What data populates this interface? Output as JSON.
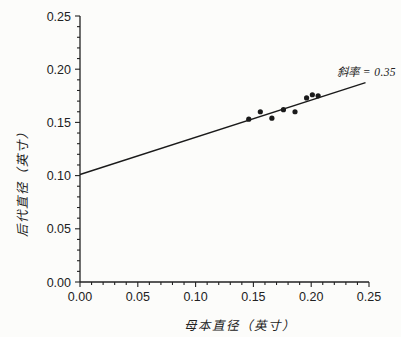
{
  "chart_data": {
    "type": "scatter",
    "title": "",
    "xlabel": "母本直径（英寸）",
    "ylabel": "后代直径（英寸）",
    "xlim": [
      0,
      0.25
    ],
    "ylim": [
      0,
      0.25
    ],
    "grid": false,
    "x_ticks": {
      "values": [
        0,
        0.05,
        0.1,
        0.15,
        0.2,
        0.25
      ],
      "labels": [
        "0.00",
        "0.05",
        "0.10",
        "0.15",
        "0.20",
        "0.25"
      ],
      "minor_step": 0.01
    },
    "y_ticks": {
      "values": [
        0,
        0.05,
        0.1,
        0.15,
        0.2,
        0.25
      ],
      "labels": [
        "0.00",
        "0.05",
        "0.10",
        "0.15",
        "0.20",
        "0.25"
      ],
      "minor_step": 0.01
    },
    "points": [
      [
        0.146,
        0.153
      ],
      [
        0.156,
        0.16
      ],
      [
        0.166,
        0.154
      ],
      [
        0.176,
        0.162
      ],
      [
        0.186,
        0.16
      ],
      [
        0.196,
        0.173
      ],
      [
        0.201,
        0.176
      ],
      [
        0.206,
        0.175
      ]
    ],
    "regression_line": {
      "slope": 0.35,
      "intercept": 0.101,
      "x_start": 0,
      "x_end": 0.247
    },
    "annotation": {
      "text": "斜率 = 0.35",
      "slope_value": 0.35
    },
    "colors": {
      "axis": "#222222",
      "line": "#1a1a1a",
      "point": "#1a1a1a",
      "text": "#222222",
      "background": "#fcfcfa"
    }
  }
}
